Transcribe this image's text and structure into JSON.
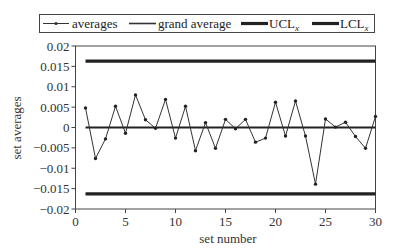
{
  "chart_data": {
    "type": "line",
    "title": "",
    "xlabel": "set number",
    "ylabel": "set averages",
    "xlim": [
      0,
      30
    ],
    "ylim": [
      -0.02,
      0.02
    ],
    "x_ticks": [
      0,
      5,
      10,
      15,
      20,
      25,
      30
    ],
    "y_ticks": [
      0.02,
      0.015,
      0.01,
      0.005,
      0,
      -0.005,
      -0.01,
      -0.015,
      -0.02
    ],
    "y_tick_labels": [
      "0.02",
      "0.015",
      "0.01",
      "0.005",
      "0",
      "-0.005",
      "-0.01",
      "-0.015",
      "-0.02"
    ],
    "x_tick_labels": [
      "0",
      "5",
      "10",
      "15",
      "20",
      "25",
      "30"
    ],
    "grid": false,
    "legend_position": "top",
    "legend": [
      {
        "label": "averages",
        "style": "thin line with dot markers"
      },
      {
        "label": "grand average",
        "style": "medium line"
      },
      {
        "label": "UCL",
        "subscript": "x",
        "style": "thick line"
      },
      {
        "label": "LCL",
        "subscript": "x",
        "style": "thick line"
      }
    ],
    "x": [
      1,
      2,
      3,
      4,
      5,
      6,
      7,
      8,
      9,
      10,
      11,
      12,
      13,
      14,
      15,
      16,
      17,
      18,
      19,
      20,
      21,
      22,
      23,
      24,
      25,
      26,
      27,
      28,
      29,
      30
    ],
    "series": [
      {
        "name": "averages",
        "values": [
          0.0048,
          -0.0076,
          -0.0028,
          0.0052,
          -0.0014,
          0.008,
          0.0019,
          -0.0002,
          0.0069,
          -0.0026,
          0.0052,
          -0.0057,
          0.0012,
          -0.0051,
          0.002,
          -0.0003,
          0.002,
          -0.0036,
          -0.0026,
          0.0062,
          -0.0021,
          0.0065,
          -0.0021,
          -0.0139,
          0.0021,
          0.0001,
          0.0013,
          -0.0022,
          -0.0051,
          0.0027
        ]
      },
      {
        "name": "grand average",
        "values": [
          0.0,
          0.0
        ],
        "x": [
          1,
          30
        ]
      },
      {
        "name": "UCL_x",
        "values": [
          0.0163,
          0.0163
        ],
        "x": [
          1,
          30
        ]
      },
      {
        "name": "LCL_x",
        "values": [
          -0.0163,
          -0.0163
        ],
        "x": [
          1,
          30
        ]
      }
    ]
  }
}
